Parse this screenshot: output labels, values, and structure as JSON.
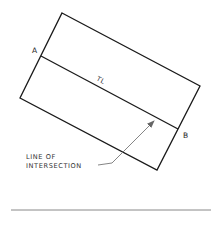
{
  "diagram": {
    "type": "descriptive-geometry",
    "plane": {
      "corners": [
        [
          62,
          13
        ],
        [
          200,
          86
        ],
        [
          157,
          170
        ],
        [
          20,
          98
        ]
      ],
      "stroke": "#1a1a1a"
    },
    "intersection_line": {
      "from": [
        41,
        56
      ],
      "to": [
        178,
        129
      ],
      "label": "TL"
    },
    "points": [
      {
        "id": "A",
        "label": "A",
        "at": [
          41,
          56
        ]
      },
      {
        "id": "B",
        "label": "B",
        "at": [
          178,
          129
        ]
      }
    ],
    "callout": {
      "line1": "LINE OF",
      "line2": "INTERSECTION",
      "leader_color": "#777777"
    },
    "baseline": {
      "from": [
        11,
        210
      ],
      "to": [
        211,
        210
      ],
      "color": "#888888"
    }
  }
}
